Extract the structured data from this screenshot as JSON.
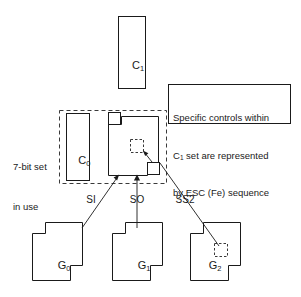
{
  "figure": {
    "background_color": "#ffffff",
    "line_color": "#1a1a1a",
    "dashed_color": "#3a3a3a"
  },
  "control_sets": {
    "c1": {
      "label": "C",
      "subscript": "1"
    },
    "c0": {
      "label": "C",
      "subscript": "0"
    }
  },
  "graphic_sets": [
    {
      "label": "G",
      "subscript": "0"
    },
    {
      "label": "G",
      "subscript": "1"
    },
    {
      "label": "G",
      "subscript": "2"
    }
  ],
  "note": {
    "line1": "Specific controls within",
    "line2_prefix": "C",
    "line2_subscript": "1",
    "line2_suffix": " set are represented",
    "line3": "by ESC (Fe) sequence"
  },
  "region": {
    "line1": "7-bit set",
    "line2": "in use"
  },
  "edges": [
    {
      "name": "si",
      "label": "SI"
    },
    {
      "name": "so",
      "label": "SO"
    },
    {
      "name": "ss2",
      "label": "SS2"
    }
  ]
}
